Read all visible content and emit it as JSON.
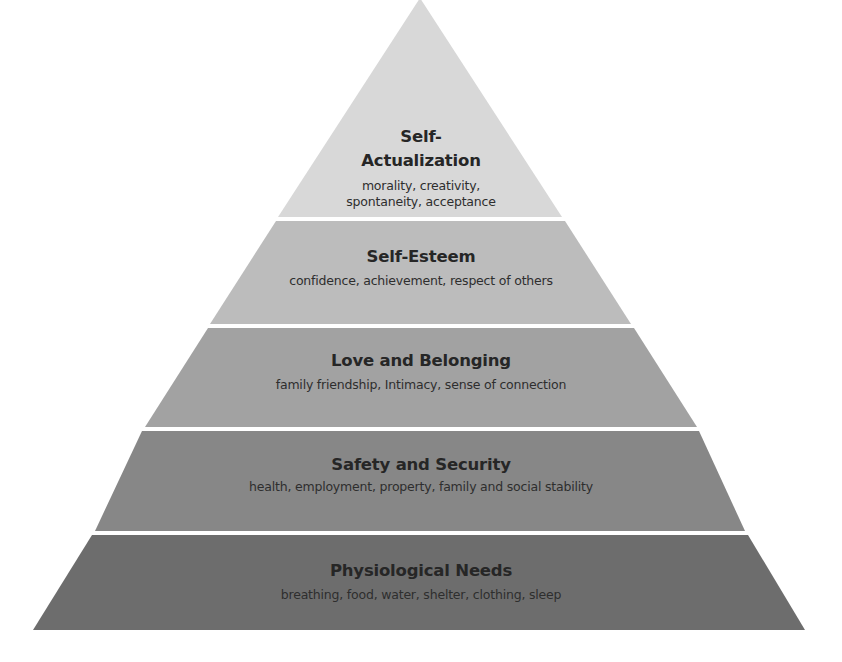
{
  "diagram": {
    "type": "pyramid",
    "colors": {
      "background": "#ffffff",
      "separator": "#ffffff",
      "text": "#262626"
    },
    "tiers": [
      {
        "title_line1": "Self-",
        "title_line2": "Actualization",
        "subtitle_line1": "morality, creativity,",
        "subtitle_line2": "spontaneity, acceptance",
        "color": "#d8d8d8"
      },
      {
        "title": "Self-Esteem",
        "subtitle": "confidence, achievement, respect of others",
        "color": "#bcbcbc"
      },
      {
        "title": "Love and Belonging",
        "subtitle": "family friendship, Intimacy, sense of connection",
        "color": "#a2a2a2"
      },
      {
        "title": "Safety and Security",
        "subtitle": "health, employment, property, family and social stability",
        "color": "#878787"
      },
      {
        "title": "Physiological Needs",
        "subtitle": "breathing, food, water, shelter, clothing, sleep",
        "color": "#6d6d6d"
      }
    ]
  }
}
